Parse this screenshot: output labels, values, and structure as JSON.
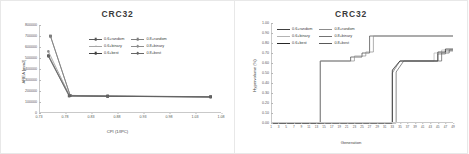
{
  "figure": {
    "panels": [
      {
        "id": "area-vs-cpi",
        "title": "CRC32",
        "xlabel": "CPI (1/IPC)",
        "ylabel": "AREA [mm2]"
      },
      {
        "id": "hypervolume-vs-generation",
        "title": "CRC32",
        "xlabel": "Generation",
        "ylabel": "Hypervolume (%)"
      }
    ]
  },
  "chart_data": [
    {
      "type": "scatter",
      "title": "CRC32",
      "xlabel": "CPI (1/IPC)",
      "ylabel": "AREA [mm2]",
      "xlim": [
        0.73,
        1.08
      ],
      "ylim": [
        0,
        800000
      ],
      "xticks": [
        "0.73",
        "0.78",
        "0.83",
        "0.88",
        "0.93",
        "0.98",
        "1.03",
        "1.08"
      ],
      "xtick_values": [
        0.73,
        0.78,
        0.83,
        0.88,
        0.93,
        0.98,
        1.03,
        1.08
      ],
      "yticks": [
        "0",
        "100000",
        "200000",
        "300000",
        "400000",
        "500000",
        "600000",
        "700000",
        "800000"
      ],
      "ytick_values": [
        0,
        100000,
        200000,
        300000,
        400000,
        500000,
        600000,
        700000,
        800000
      ],
      "grid": false,
      "legend_position": "upper-center",
      "series": [
        {
          "name": "0.6+random",
          "color": "#595959",
          "marker": "square",
          "points": [
            [
              0.752,
              700000
            ],
            [
              0.79,
              160000
            ],
            [
              0.862,
              155000
            ],
            [
              1.06,
              148000
            ]
          ]
        },
        {
          "name": "0.8+random",
          "color": "#7f7f7f",
          "marker": "square",
          "points": [
            [
              0.752,
              698000
            ],
            [
              0.79,
              158000
            ],
            [
              0.862,
              154000
            ],
            [
              1.06,
              147000
            ]
          ]
        },
        {
          "name": "0.6+binary",
          "color": "#a6a6a6",
          "marker": "triangle",
          "points": [
            [
              0.748,
              530000
            ],
            [
              0.789,
              157000
            ],
            [
              0.862,
              153000
            ],
            [
              1.06,
              147000
            ]
          ]
        },
        {
          "name": "0.8+binary",
          "color": "#8c8c8c",
          "marker": "circle",
          "points": [
            [
              0.748,
              560000
            ],
            [
              0.789,
              156000
            ],
            [
              0.862,
              153000
            ],
            [
              1.06,
              146000
            ]
          ]
        },
        {
          "name": "0.6+best",
          "color": "#404040",
          "marker": "square",
          "points": [
            [
              0.748,
              520000
            ],
            [
              0.788,
              155000
            ],
            [
              0.862,
              152000
            ],
            [
              1.06,
              146000
            ]
          ]
        },
        {
          "name": "0.8+best",
          "color": "#666666",
          "marker": "circle",
          "points": [
            [
              0.748,
              515000
            ],
            [
              0.788,
              154000
            ],
            [
              0.862,
              152000
            ],
            [
              1.06,
              145000
            ]
          ]
        }
      ]
    },
    {
      "type": "line",
      "title": "CRC32",
      "xlabel": "Generation",
      "ylabel": "Hypervolume (%)",
      "xlim": [
        1,
        49
      ],
      "ylim": [
        0.0,
        1.0
      ],
      "xticks": [
        "1",
        "3",
        "5",
        "7",
        "9",
        "11",
        "13",
        "15",
        "17",
        "19",
        "21",
        "23",
        "25",
        "27",
        "29",
        "31",
        "33",
        "35",
        "37",
        "39",
        "41",
        "43",
        "45",
        "47",
        "49"
      ],
      "xtick_values": [
        1,
        3,
        5,
        7,
        9,
        11,
        13,
        15,
        17,
        19,
        21,
        23,
        25,
        27,
        29,
        31,
        33,
        35,
        37,
        39,
        41,
        43,
        45,
        47,
        49
      ],
      "yticks": [
        "0.00",
        "0.10",
        "0.20",
        "0.30",
        "0.40",
        "0.50",
        "0.60",
        "0.70",
        "0.80",
        "0.90",
        "1.00"
      ],
      "ytick_values": [
        0.0,
        0.1,
        0.2,
        0.3,
        0.4,
        0.5,
        0.6,
        0.7,
        0.8,
        0.9,
        1.0
      ],
      "grid": false,
      "legend_position": "upper-left",
      "series": [
        {
          "name": "0.6+random",
          "color": "#404040",
          "points": [
            [
              1,
              0.0
            ],
            [
              14,
              0.0
            ],
            [
              14,
              0.62
            ],
            [
              22,
              0.62
            ],
            [
              22,
              0.66
            ],
            [
              25,
              0.66
            ],
            [
              25,
              0.7
            ],
            [
              27,
              0.7
            ],
            [
              27,
              0.87
            ],
            [
              49,
              0.87
            ]
          ]
        },
        {
          "name": "0.8+random",
          "color": "#8c8c8c",
          "points": [
            [
              1,
              0.0
            ],
            [
              14,
              0.0
            ],
            [
              14,
              0.62
            ],
            [
              23,
              0.62
            ],
            [
              23,
              0.67
            ],
            [
              26,
              0.67
            ],
            [
              26,
              0.71
            ],
            [
              28,
              0.71
            ],
            [
              28,
              0.87
            ],
            [
              49,
              0.87
            ]
          ]
        },
        {
          "name": "0.6+binary",
          "color": "#b3b3b3",
          "points": [
            [
              1,
              0.0
            ],
            [
              33,
              0.0
            ],
            [
              33,
              0.52
            ],
            [
              35,
              0.62
            ],
            [
              44,
              0.62
            ],
            [
              44,
              0.7
            ],
            [
              46,
              0.7
            ],
            [
              46,
              0.73
            ],
            [
              49,
              0.73
            ]
          ]
        },
        {
          "name": "0.8+binary",
          "color": "#737373",
          "points": [
            [
              1,
              0.0
            ],
            [
              33,
              0.0
            ],
            [
              33,
              0.5
            ],
            [
              35,
              0.62
            ],
            [
              45,
              0.62
            ],
            [
              45,
              0.69
            ],
            [
              47,
              0.69
            ],
            [
              47,
              0.72
            ],
            [
              49,
              0.72
            ]
          ]
        },
        {
          "name": "0.6+best",
          "color": "#262626",
          "points": [
            [
              1,
              0.0
            ],
            [
              33,
              0.0
            ],
            [
              33,
              0.53
            ],
            [
              35,
              0.62
            ],
            [
              45,
              0.62
            ],
            [
              45,
              0.71
            ],
            [
              47,
              0.71
            ],
            [
              47,
              0.74
            ],
            [
              49,
              0.74
            ]
          ]
        },
        {
          "name": "0.8+best",
          "color": "#595959",
          "points": [
            [
              1,
              0.0
            ],
            [
              34,
              0.0
            ],
            [
              34,
              0.51
            ],
            [
              36,
              0.62
            ],
            [
              46,
              0.62
            ],
            [
              46,
              0.7
            ],
            [
              48,
              0.7
            ],
            [
              48,
              0.73
            ],
            [
              49,
              0.73
            ]
          ]
        }
      ]
    }
  ],
  "legends": {
    "left": [
      {
        "label": "0.6+random",
        "color": "#595959",
        "marker": "square"
      },
      {
        "label": "0.8+random",
        "color": "#7f7f7f",
        "marker": "square"
      },
      {
        "label": "0.6+binary",
        "color": "#a6a6a6",
        "marker": "triangle"
      },
      {
        "label": "0.8+binary",
        "color": "#8c8c8c",
        "marker": "circle"
      },
      {
        "label": "0.6+best",
        "color": "#404040",
        "marker": "square"
      },
      {
        "label": "0.8+best",
        "color": "#666666",
        "marker": "circle"
      }
    ],
    "right": [
      {
        "label": "0.6+random",
        "color": "#404040"
      },
      {
        "label": "0.8+random",
        "color": "#8c8c8c"
      },
      {
        "label": "0.6+binary",
        "color": "#b3b3b3"
      },
      {
        "label": "0.8+binary",
        "color": "#737373"
      },
      {
        "label": "0.6+best",
        "color": "#262626"
      },
      {
        "label": "0.8+best",
        "color": "#595959"
      }
    ]
  }
}
